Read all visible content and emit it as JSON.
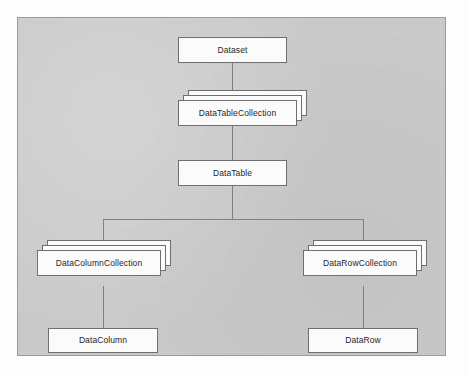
{
  "diagram": {
    "background_color": "#c9c9c9",
    "panel_border_color": "#9a9a9a",
    "box_fill_color": "#fbfbfb",
    "box_border_color": "#6f6f6f",
    "line_color": "#7f7f7f",
    "text_color": "#1f1f1f",
    "nodes": [
      {
        "id": "dataset",
        "label": "Dataset",
        "kind": "single"
      },
      {
        "id": "datatablecollection",
        "label": "DataTableCollection",
        "kind": "stack"
      },
      {
        "id": "datatable",
        "label": "DataTable",
        "kind": "single"
      },
      {
        "id": "datacolumncollection",
        "label": "DataColumnCollection",
        "kind": "stack"
      },
      {
        "id": "datarowcollection",
        "label": "DataRowCollection",
        "kind": "stack"
      },
      {
        "id": "datacolumn",
        "label": "DataColumn",
        "kind": "single"
      },
      {
        "id": "datarow",
        "label": "DataRow",
        "kind": "single"
      }
    ],
    "edges": [
      {
        "from": "dataset",
        "to": "datatablecollection"
      },
      {
        "from": "datatablecollection",
        "to": "datatable"
      },
      {
        "from": "datatable",
        "to": "datacolumncollection"
      },
      {
        "from": "datatable",
        "to": "datarowcollection"
      },
      {
        "from": "datacolumncollection",
        "to": "datacolumn"
      },
      {
        "from": "datarowcollection",
        "to": "datarow"
      }
    ]
  }
}
